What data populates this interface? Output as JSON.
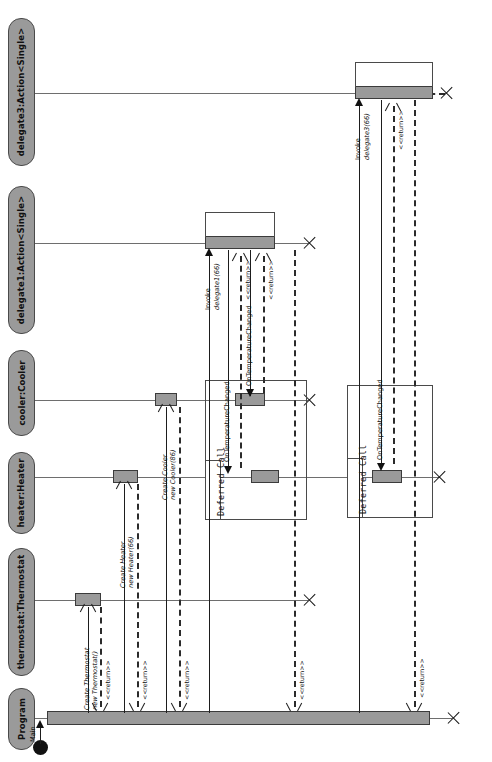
{
  "diagram": {
    "type": "uml-sequence-diagram",
    "orientation": "rotated-90-ccw",
    "colors": {
      "lifeline_header_fill": "#9a9a9a",
      "activation_fill": "#9a9a9a",
      "stroke": "#1d1d1d",
      "background": "#ffffff"
    }
  },
  "lifelines": [
    {
      "id": "delegate3",
      "label": "delegate3:Action<Single>"
    },
    {
      "id": "delegate1",
      "label": "delegate1:Action<Single>"
    },
    {
      "id": "cooler",
      "label": "cooler:Cooler"
    },
    {
      "id": "heater",
      "label": "heater:Heater"
    },
    {
      "id": "thermostat",
      "label": "thermostat:Thermostat"
    },
    {
      "id": "program",
      "label": "Program"
    }
  ],
  "messages": [
    {
      "id": "m0",
      "label": "Main",
      "kind": "found-start"
    },
    {
      "id": "m1",
      "label": "Create Thermostat",
      "sublabel": "new Thermostat()",
      "kind": "create"
    },
    {
      "id": "m2",
      "label": "Create Heater",
      "sublabel": "new Heater(66)",
      "kind": "create"
    },
    {
      "id": "m3",
      "label": "Create Cooler",
      "sublabel": "new Cooler(86)",
      "kind": "create"
    },
    {
      "id": "m4",
      "label": "Invoke",
      "sublabel": "delegate1(66)",
      "kind": "sync"
    },
    {
      "id": "m5",
      "label": "OnTemperatureChanged",
      "kind": "sync"
    },
    {
      "id": "m6",
      "label": "OnTemperatureChanged",
      "kind": "sync"
    },
    {
      "id": "m7",
      "label": "Invoke",
      "sublabel": "delegate3(66)",
      "kind": "sync"
    },
    {
      "id": "m8",
      "label": "OnTemperatureChanged",
      "kind": "sync"
    }
  ],
  "returns": [
    {
      "id": "r1",
      "label": "<<return>>"
    },
    {
      "id": "r2",
      "label": "<<return>>"
    },
    {
      "id": "r3",
      "label": "<<return>>"
    },
    {
      "id": "r4",
      "label": "<<return>>"
    },
    {
      "id": "r5",
      "label": "<<return>>"
    },
    {
      "id": "r6",
      "label": "<<return>>"
    },
    {
      "id": "r7",
      "label": "<<return>>"
    },
    {
      "id": "r8",
      "label": "<<return>>"
    }
  ],
  "fragments": [
    {
      "id": "f1",
      "label": "Deferred Call"
    },
    {
      "id": "f2",
      "label": "Deferred Call"
    }
  ]
}
